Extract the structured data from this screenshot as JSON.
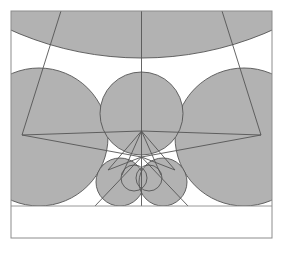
{
  "figure": {
    "type": "geometric-diagram",
    "width": 283,
    "height": 253,
    "background_color": "#ffffff",
    "fill_color": "#b2b2b2",
    "stroke_color": "#555555",
    "frame_color": "#8c8c8c",
    "stroke_width": 0.8,
    "frame": {
      "x": 11,
      "y": 11,
      "width": 261,
      "height": 227
    },
    "baseline_y": 206,
    "circles": [
      {
        "name": "outer-arc-circle",
        "cx": 141.5,
        "cy": -262,
        "r": 320,
        "filled": true,
        "note": "large arc crossing near top of frame"
      },
      {
        "name": "left-large-circle",
        "cx": 39,
        "cy": 137,
        "r": 69,
        "filled": true
      },
      {
        "name": "right-large-circle",
        "cx": 244,
        "cy": 137,
        "r": 69,
        "filled": true
      },
      {
        "name": "center-circle",
        "cx": 141.5,
        "cy": 113.5,
        "r": 41.5,
        "filled": true
      },
      {
        "name": "bottom-left-circle",
        "cx": 120,
        "cy": 182,
        "r": 24,
        "filled": true
      },
      {
        "name": "bottom-right-circle",
        "cx": 163,
        "cy": 182,
        "r": 24,
        "filled": true
      },
      {
        "name": "lens-left-circle",
        "cx": 134,
        "cy": 178,
        "r": 13,
        "filled": false
      },
      {
        "name": "lens-right-circle",
        "cx": 149,
        "cy": 178,
        "r": 13,
        "filled": false
      }
    ],
    "polygon_outer": {
      "name": "outer-polygon",
      "points": "77,-40 22,135 141.5,131 261,135 206,-40"
    },
    "polygon_inner": {
      "name": "inner-polygon",
      "points": "141.5,131 108,170 141.5,157 175,170"
    },
    "lines": [
      {
        "name": "vertical-axis-line",
        "x1": 141.5,
        "y1": 11,
        "x2": 141.5,
        "y2": 206
      },
      {
        "name": "spoke-left-outer",
        "x1": 141.5,
        "y1": 157,
        "x2": 95,
        "y2": 206
      },
      {
        "name": "spoke-right-outer",
        "x1": 141.5,
        "y1": 157,
        "x2": 188,
        "y2": 206
      },
      {
        "name": "spoke-left-upper",
        "x1": 141.5,
        "y1": 131,
        "x2": 122,
        "y2": 175
      },
      {
        "name": "spoke-right-upper",
        "x1": 141.5,
        "y1": 131,
        "x2": 161,
        "y2": 175
      },
      {
        "name": "chord-left-vertex",
        "x1": 22,
        "y1": 135,
        "x2": 141.5,
        "y2": 157
      },
      {
        "name": "chord-right-vertex",
        "x1": 261,
        "y1": 135,
        "x2": 141.5,
        "y2": 157
      }
    ]
  }
}
